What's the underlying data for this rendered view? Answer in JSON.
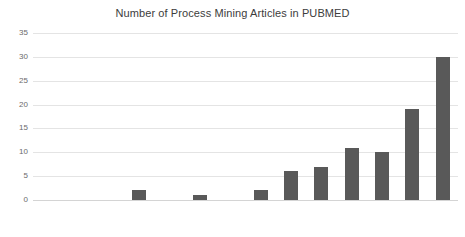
{
  "chart_data": {
    "type": "bar",
    "title": "Number of Process Mining Articles in PUBMED",
    "xlabel": "",
    "ylabel": "",
    "categories": [
      "2005",
      "2006",
      "2007",
      "2008",
      "2009",
      "2010",
      "2011",
      "2012",
      "2013",
      "2014",
      "2015",
      "2016",
      "2017",
      "2018"
    ],
    "values": [
      0,
      0,
      0,
      2,
      0,
      1,
      0,
      2,
      6,
      7,
      11,
      10,
      19,
      30
    ],
    "ylim": [
      0,
      35
    ],
    "yticks": [
      0,
      5,
      10,
      15,
      20,
      25,
      30,
      35
    ],
    "ytick_labels": [
      "0",
      "5",
      "10",
      "15",
      "20",
      "25",
      "30",
      "35"
    ],
    "grid": true,
    "legend": false,
    "bar_color": "#595959",
    "grid_color": "#e4e4e4",
    "axis_text_color": "#6b6b6b",
    "title_color": "#3c3c3c",
    "background": "#ffffff"
  }
}
